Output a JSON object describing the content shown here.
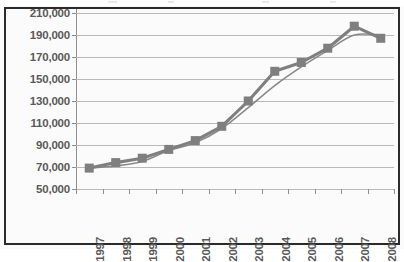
{
  "chart_data": {
    "type": "line",
    "title": "",
    "subtitle": "",
    "xlabel": "",
    "ylabel": "",
    "categories": [
      "1997",
      "1998",
      "1999",
      "2000",
      "2001",
      "2002",
      "2003",
      "2004",
      "2005",
      "2006",
      "2007",
      "2008"
    ],
    "ylim": [
      50000,
      210000
    ],
    "ytick_step": 20000,
    "ytick_labels": [
      "210,000",
      "190,000",
      "170,000",
      "150,000",
      "130,000",
      "110,000",
      "90,000",
      "70,000",
      "50,000"
    ],
    "ytick_values": [
      210000,
      190000,
      170000,
      150000,
      130000,
      110000,
      90000,
      70000,
      50000
    ],
    "grid": true,
    "legend": "none",
    "series": [
      {
        "name": "series-1-markers",
        "style": "thick-line-with-square-markers",
        "color": "#7f7f7f",
        "marker": "square",
        "values": [
          69000,
          74000,
          78000,
          86000,
          94000,
          107000,
          130000,
          157000,
          165000,
          178000,
          198000,
          187000
        ]
      },
      {
        "name": "series-2-smooth",
        "style": "thin-smooth-line",
        "color": "#8a8a8a",
        "marker": "none",
        "values": [
          69000,
          71000,
          75000,
          85000,
          92000,
          105000,
          124000,
          144000,
          161000,
          176000,
          190000,
          190000
        ]
      }
    ],
    "colors": {
      "marker": "#7f7f7f",
      "line_thick": "#7f7f7f",
      "line_thin": "#8a8a8a",
      "gridline": "#b9b9b9",
      "axis": "#8f8f8f",
      "tick_text": "#5a5a5a",
      "frame": "#2b2b2b",
      "plot_background": "#fbfbfb"
    }
  }
}
